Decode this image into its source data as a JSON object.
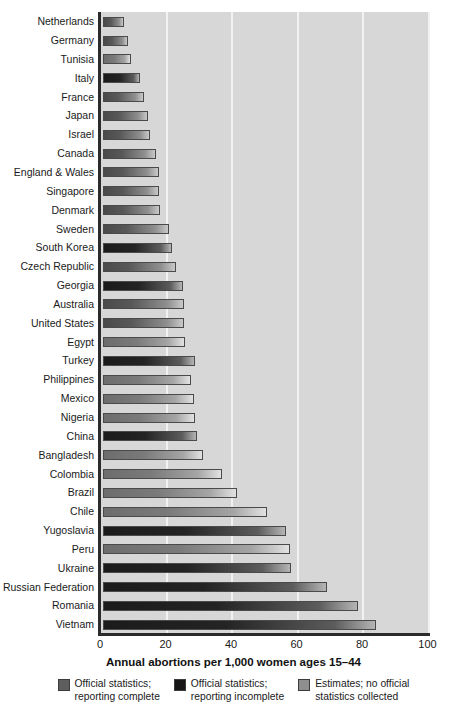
{
  "chart_data": {
    "type": "bar",
    "orientation": "horizontal",
    "title": "",
    "xlabel": "Annual abortions per 1,000 women ages 15–44",
    "ylabel": "",
    "xlim": [
      0,
      110
    ],
    "xticks": [
      0,
      20,
      40,
      60,
      80,
      100
    ],
    "xtick_labels": [
      "0",
      "20",
      "40",
      "60",
      "80",
      "100"
    ],
    "grid": "vertical",
    "legend_position": "bottom",
    "categories": [
      "Netherlands",
      "Germany",
      "Tunisia",
      "Italy",
      "France",
      "Japan",
      "Israel",
      "Canada",
      "England & Wales",
      "Singapore",
      "Denmark",
      "Sweden",
      "South Korea",
      "Czech Republic",
      "Georgia",
      "Australia",
      "United States",
      "Egypt",
      "Turkey",
      "Philippines",
      "Mexico",
      "Nigeria",
      "China",
      "Bangladesh",
      "Colombia",
      "Brazil",
      "Chile",
      "Yugoslavia",
      "Peru",
      "Ukraine",
      "Russian Federation",
      "Romania",
      "Vietnam"
    ],
    "values": [
      6.5,
      7.6,
      8.6,
      11.4,
      12.4,
      13.8,
      14.4,
      16.1,
      17.0,
      17.2,
      17.4,
      20.0,
      21.0,
      22.3,
      24.5,
      24.8,
      24.8,
      25.0,
      28.0,
      27.0,
      27.8,
      28.0,
      28.8,
      30.4,
      36.3,
      40.8,
      50.0,
      56.0,
      57.0,
      57.5,
      68.4,
      78.0,
      83.3
    ],
    "series_category": [
      "complete",
      "complete",
      "estimates",
      "incomplete",
      "complete",
      "complete",
      "complete",
      "complete",
      "complete",
      "complete",
      "complete",
      "complete",
      "incomplete",
      "complete",
      "incomplete",
      "complete",
      "complete",
      "estimates",
      "incomplete",
      "estimates",
      "estimates",
      "estimates",
      "incomplete",
      "estimates",
      "estimates",
      "estimates",
      "estimates",
      "incomplete",
      "estimates",
      "incomplete",
      "incomplete",
      "incomplete",
      "incomplete"
    ],
    "legend": [
      {
        "key": "complete",
        "label_line1": "Official statistics;",
        "label_line2": "reporting complete",
        "color": "#5e5e5e"
      },
      {
        "key": "incomplete",
        "label_line1": "Official statistics;",
        "label_line2": "reporting incomplete",
        "color": "#161616"
      },
      {
        "key": "estimates",
        "label_line1": "Estimates; no official",
        "label_line2": "statistics collected",
        "color": "#8e8e8e"
      }
    ],
    "plot_background": "#d7d7d7",
    "gridline_color": "#f2f2f2",
    "axis_color": "#2b2b2b"
  }
}
